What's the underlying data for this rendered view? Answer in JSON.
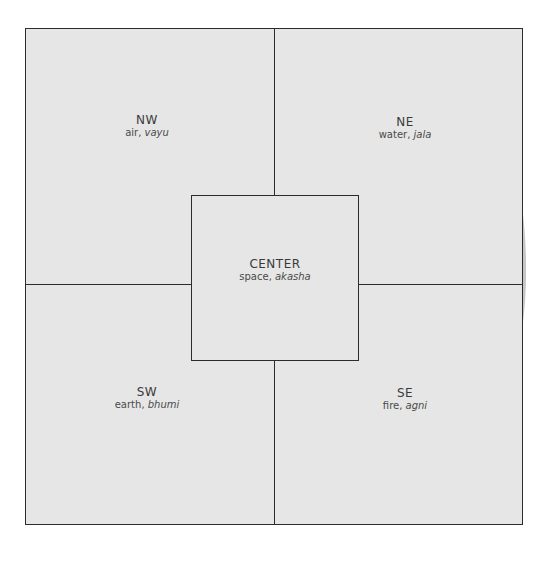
{
  "diagram": {
    "type": "vastu-mandala-quadrants",
    "background_color": "#e6e6e6",
    "line_color": "#2c2c2c",
    "sketch_color": "#c4c4c4",
    "regions": {
      "nw": {
        "direction": "NW",
        "element": "air",
        "sanskrit": "vayu"
      },
      "ne": {
        "direction": "NE",
        "element": "water",
        "sanskrit": "jala"
      },
      "center": {
        "direction": "CENTER",
        "element": "space",
        "sanskrit": "akasha"
      },
      "sw": {
        "direction": "SW",
        "element": "earth",
        "sanskrit": "bhumi"
      },
      "se": {
        "direction": "SE",
        "element": "fire",
        "sanskrit": "agni"
      }
    }
  }
}
